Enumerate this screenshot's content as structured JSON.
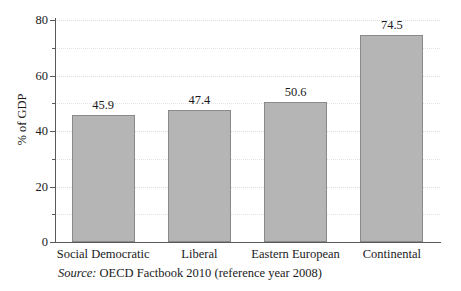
{
  "chart_data": {
    "type": "bar",
    "title": "",
    "xlabel": "",
    "ylabel": "% of GDP",
    "categories": [
      "Social Democratic",
      "Liberal",
      "Eastern European",
      "Continental"
    ],
    "values": [
      45.9,
      47.4,
      50.6,
      74.5
    ],
    "value_labels": [
      "45.9",
      "47.4",
      "50.6",
      "74.5"
    ],
    "ylim": [
      0,
      80
    ],
    "ytick_labels": [
      "0",
      "20",
      "40",
      "60",
      "80"
    ],
    "ytick_values": [
      0,
      20,
      40,
      60,
      80
    ],
    "yminor_values": [
      10,
      30,
      50,
      70
    ],
    "grid": true,
    "legend": "none",
    "bar_color": "#b5b5b5",
    "bar_edge_color": "#8a8a8a",
    "axis_color": "#595959",
    "grid_color": "#e3e3e3"
  },
  "caption": {
    "source_keyword": "Source:",
    "source_text": "OECD Factbook 2010 (reference year 2008)"
  }
}
